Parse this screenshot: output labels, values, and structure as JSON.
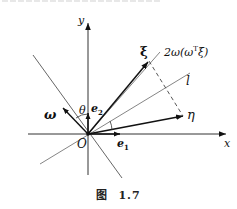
{
  "figure": {
    "caption_prefix": "图",
    "caption_number": "1.7"
  },
  "labels": {
    "y_axis": "y",
    "x_axis": "x",
    "origin": "O",
    "xi": "ξ",
    "eta": "η",
    "omega": "ω",
    "theta": "θ",
    "e1": "e",
    "e1_sub": "1",
    "e2": "e",
    "e2_sub": "2",
    "line_l": "l",
    "reflection_term_prefix": "2ω(ω",
    "reflection_term_sup": "T",
    "reflection_term_suffix": "ξ)"
  },
  "colors": {
    "ink": "#111111",
    "thin_line": "#555555",
    "dashed": "#444444"
  }
}
